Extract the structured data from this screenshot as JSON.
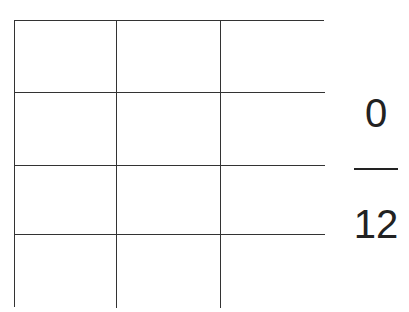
{
  "diagram": {
    "type": "fraction-area-model",
    "grid": {
      "columns": 3,
      "rows": 4,
      "total_cells": 12,
      "shaded_cells": 0,
      "cells": [
        {
          "shaded": false
        },
        {
          "shaded": false
        },
        {
          "shaded": false
        },
        {
          "shaded": false
        },
        {
          "shaded": false
        },
        {
          "shaded": false
        },
        {
          "shaded": false
        },
        {
          "shaded": false
        },
        {
          "shaded": false
        },
        {
          "shaded": false
        },
        {
          "shaded": false
        },
        {
          "shaded": false
        }
      ],
      "line_color": "#333333",
      "fill_color": "#ffffff"
    },
    "fraction": {
      "numerator": "0",
      "denominator": "12"
    }
  }
}
